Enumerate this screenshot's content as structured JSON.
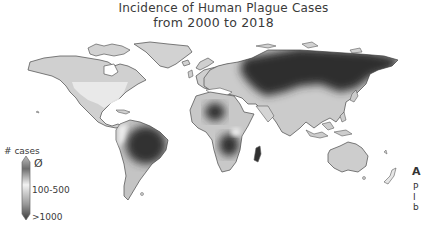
{
  "title": {
    "line1": "Incidence of Human Plague Cases",
    "line2": "from 2000 to 2018"
  },
  "legend": {
    "title": "# cases",
    "labels": [
      "Ø",
      "100-500",
      ">1000"
    ],
    "gradient": [
      "#c9c9c9",
      "#6e6e6e",
      "#f2f2f2",
      "#9a9a9a",
      "#3a3a3a"
    ]
  },
  "colors": {
    "background": "#ffffff",
    "land_low": "#cfcfcf",
    "land_zero": "#e8e8e8",
    "land_mid": "#b4b4b4",
    "land_high": "#3b3b3b",
    "outline": "#5a5a5a"
  },
  "regions": [
    {
      "name": "Russia / Central Asia",
      "level": "high"
    },
    {
      "name": "Brazil / Amazon",
      "level": "high"
    },
    {
      "name": "Central-Southern Africa (DRC, Zambia)",
      "level": "high"
    },
    {
      "name": "Sahara / Chad region",
      "level": "high"
    },
    {
      "name": "Madagascar",
      "level": "high"
    },
    {
      "name": "Western USA",
      "level": "zero"
    },
    {
      "name": "Europe",
      "level": "low"
    },
    {
      "name": "Australia",
      "level": "low"
    }
  ],
  "cutoff_text": [
    "A",
    "P",
    "I",
    "b"
  ]
}
